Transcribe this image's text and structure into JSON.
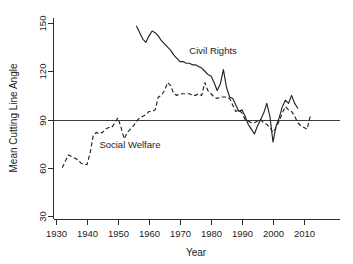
{
  "chart_data": {
    "type": "line",
    "title": "",
    "xlabel": "Year",
    "ylabel": "Mean Cutting Line Angle",
    "xlim": [
      1928,
      2014
    ],
    "ylim": [
      30,
      156
    ],
    "xticks": [
      1930,
      1940,
      1950,
      1960,
      1970,
      1980,
      1990,
      2000,
      2010
    ],
    "yticks": [
      30,
      60,
      90,
      120,
      150
    ],
    "grid": false,
    "legend_position": "inline-annotations",
    "reference_lines": [
      {
        "name": "ninety-degree-line",
        "axis": "y",
        "value": 90
      }
    ],
    "annotations": [
      {
        "text": "Civil Rights",
        "x": 1973,
        "y": 131
      },
      {
        "text": "Social Welfare",
        "x": 1944,
        "y": 72
      }
    ],
    "series": [
      {
        "name": "Civil Rights",
        "style": "solid",
        "x": [
          1956,
          1957,
          1958,
          1959,
          1960,
          1961,
          1962,
          1963,
          1964,
          1965,
          1966,
          1967,
          1968,
          1969,
          1970,
          1971,
          1972,
          1973,
          1974,
          1975,
          1976,
          1977,
          1978,
          1979,
          1980,
          1981,
          1982,
          1983,
          1984,
          1985,
          1986,
          1987,
          1988,
          1989,
          1990,
          1991,
          1992,
          1993,
          1994,
          1995,
          1996,
          1997,
          1998,
          1999,
          2000,
          2001,
          2002,
          2003,
          2004,
          2005,
          2006,
          2007,
          2008
        ],
        "values": [
          148,
          144,
          140,
          138,
          142,
          145,
          144,
          142,
          139,
          137,
          135,
          133,
          130,
          128,
          126,
          126,
          125,
          125,
          124,
          124,
          123,
          122,
          120,
          118,
          117,
          113,
          108,
          112,
          121,
          110,
          104,
          103,
          99,
          95,
          96,
          92,
          87,
          84,
          81,
          86,
          90,
          94,
          100,
          92,
          76,
          86,
          91,
          98,
          102,
          100,
          105,
          100,
          97
        ]
      },
      {
        "name": "Social Welfare",
        "style": "dashed",
        "x": [
          1932,
          1933,
          1934,
          1935,
          1936,
          1937,
          1938,
          1939,
          1940,
          1941,
          1942,
          1943,
          1944,
          1945,
          1946,
          1947,
          1948,
          1949,
          1950,
          1951,
          1952,
          1953,
          1954,
          1955,
          1956,
          1957,
          1958,
          1959,
          1960,
          1961,
          1962,
          1963,
          1964,
          1965,
          1966,
          1967,
          1968,
          1969,
          1970,
          1971,
          1972,
          1973,
          1974,
          1975,
          1976,
          1977,
          1978,
          1979,
          1980,
          1981,
          1982,
          1983,
          1984,
          1985,
          1986,
          1987,
          1988,
          1989,
          1990,
          1991,
          1992,
          1993,
          1994,
          1995,
          1996,
          1997,
          1998,
          1999,
          2000,
          2001,
          2002,
          2003,
          2004,
          2005,
          2006,
          2007,
          2008,
          2009,
          2010,
          2011,
          2012
        ],
        "values": [
          60,
          64,
          68,
          67,
          66,
          65,
          63,
          62,
          62,
          69,
          80,
          82,
          81,
          82,
          84,
          85,
          85,
          88,
          91,
          85,
          78,
          82,
          84,
          86,
          89,
          91,
          92,
          93,
          95,
          95,
          96,
          104,
          105,
          108,
          113,
          111,
          106,
          105,
          106,
          106,
          106,
          106,
          105,
          105,
          106,
          105,
          113,
          108,
          106,
          104,
          103,
          104,
          104,
          104,
          103,
          99,
          95,
          96,
          94,
          90,
          89,
          88,
          88,
          89,
          90,
          88,
          87,
          85,
          82,
          85,
          89,
          94,
          98,
          96,
          95,
          92,
          88,
          86,
          85,
          84,
          92
        ]
      }
    ]
  },
  "axes": {
    "y_title": "Mean Cutting Line Angle",
    "x_title": "Year",
    "y_tick_labels": [
      "30",
      "60",
      "90",
      "120",
      "150"
    ],
    "x_tick_labels": [
      "1930",
      "1940",
      "1950",
      "1960",
      "1970",
      "1980",
      "1990",
      "2000",
      "2010"
    ]
  },
  "labels": {
    "civil_rights": "Civil Rights",
    "social_welfare": "Social Welfare"
  },
  "colors": {
    "series_stroke": "#232323",
    "axis": "#2b2b2b",
    "reference_line": "#3d3d3d",
    "background": "#ffffff"
  }
}
